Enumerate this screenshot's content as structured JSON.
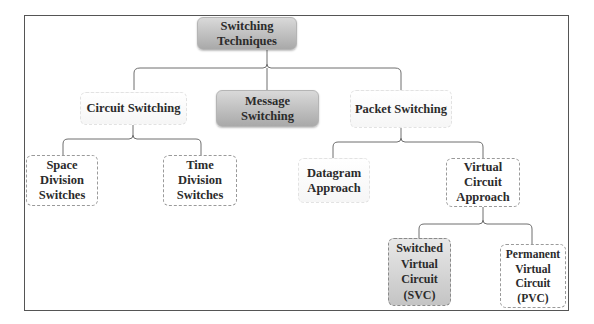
{
  "diagram": {
    "title": "Switching Techniques",
    "root": {
      "label": "Switching Techniques"
    },
    "level1": [
      {
        "label": "Circuit Switching"
      },
      {
        "label": "Message Switching"
      },
      {
        "label": "Packet Switching"
      }
    ],
    "circuit_children": [
      {
        "label": "Space\nDivision\nSwitches"
      },
      {
        "label": "Time\nDivision\nSwitches"
      }
    ],
    "packet_children": [
      {
        "label": "Datagram\nApproach"
      },
      {
        "label": "Virtual\nCircuit\nApproach"
      }
    ],
    "virtual_circuit_children": [
      {
        "label": "Switched\nVirtual\nCircuit\n(SVC)"
      },
      {
        "label": "Permanent\nVirtual\nCircuit\n(PVC)"
      }
    ],
    "colors": {
      "frame": "#555555",
      "connector": "#6e6e6e",
      "highlight_fill_top": "#d9d9d9",
      "highlight_fill_bottom": "#a9a9a9",
      "text": "#2b2b2b"
    }
  }
}
